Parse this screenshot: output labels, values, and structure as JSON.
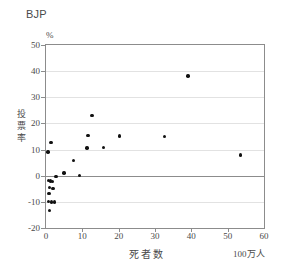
{
  "chart_data": {
    "type": "scatter",
    "title": "BJP",
    "xlabel": "死者数",
    "xunit": "100万人",
    "ylabel": "投票率",
    "yunit": "%",
    "xlim": [
      0,
      60
    ],
    "ylim": [
      -20,
      50
    ],
    "xticks": [
      0,
      10,
      20,
      30,
      40,
      50,
      60
    ],
    "yticks": [
      -20,
      -10,
      0,
      10,
      20,
      30,
      40,
      50
    ],
    "xtick_labels": [
      "0",
      "10",
      "20",
      "30",
      "40",
      "50",
      "60"
    ],
    "ytick_labels": [
      "-20",
      "-10",
      "0",
      "10",
      "20",
      "30",
      "40",
      "50"
    ],
    "grid": "horizontal",
    "zero_line": true,
    "legend": "none",
    "marker": "filled-circle",
    "marker_color": "#111111",
    "points": [
      {
        "x": 0.6,
        "y": 9.0
      },
      {
        "x": 1.4,
        "y": 12.6
      },
      {
        "x": 0.7,
        "y": -1.9
      },
      {
        "x": 1.3,
        "y": -2.0
      },
      {
        "x": 1.8,
        "y": -2.1
      },
      {
        "x": 1.0,
        "y": -4.6
      },
      {
        "x": 1.9,
        "y": -4.8
      },
      {
        "x": 0.8,
        "y": -6.8
      },
      {
        "x": 0.7,
        "y": -9.9
      },
      {
        "x": 1.5,
        "y": -10.0
      },
      {
        "x": 2.3,
        "y": -10.1
      },
      {
        "x": 0.9,
        "y": -13.3
      },
      {
        "x": 2.8,
        "y": -0.4
      },
      {
        "x": 4.9,
        "y": 1.0
      },
      {
        "x": 7.6,
        "y": 5.9
      },
      {
        "x": 9.3,
        "y": 0.2
      },
      {
        "x": 11.3,
        "y": 10.6
      },
      {
        "x": 11.6,
        "y": 15.3
      },
      {
        "x": 12.7,
        "y": 23.1
      },
      {
        "x": 15.9,
        "y": 10.7
      },
      {
        "x": 20.3,
        "y": 15.2
      },
      {
        "x": 32.6,
        "y": 14.9
      },
      {
        "x": 39.1,
        "y": 38.2
      },
      {
        "x": 53.5,
        "y": 7.9
      }
    ]
  },
  "axis_title_chars": {
    "y1": "投",
    "y2": "票",
    "y3": "率"
  }
}
